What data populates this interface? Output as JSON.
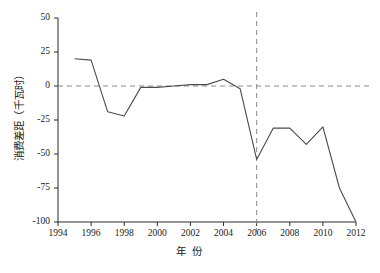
{
  "chart_data": {
    "type": "line",
    "title": "",
    "xlabel": "年 份",
    "ylabel": "消费差距（千瓦时）",
    "xlim": [
      1994,
      2012
    ],
    "ylim": [
      -100,
      50
    ],
    "xticks": [
      1994,
      1996,
      1998,
      2000,
      2002,
      2004,
      2006,
      2008,
      2010,
      2012
    ],
    "yticks": [
      50,
      25,
      0,
      -25,
      -50,
      -75,
      -100
    ],
    "grid": false,
    "legend": null,
    "x": [
      1995,
      1996,
      1997,
      1998,
      1999,
      2000,
      2001,
      2002,
      2003,
      2004,
      2005,
      2006,
      2007,
      2008,
      2009,
      2010,
      2011,
      2012
    ],
    "values": [
      20,
      19,
      -19,
      -22,
      -1,
      -1,
      0,
      1,
      1,
      5,
      -2,
      -54,
      -31,
      -31,
      -43,
      -30,
      -75,
      -100
    ],
    "series": [
      {
        "name": "消费差距",
        "values": [
          20,
          19,
          -19,
          -22,
          -1,
          -1,
          0,
          1,
          1,
          5,
          -2,
          -54,
          -31,
          -31,
          -43,
          -30,
          -75,
          -100
        ]
      }
    ],
    "annotations": [
      {
        "name": "zero-reference-line",
        "type": "hline",
        "value": 0,
        "style": "dashed"
      },
      {
        "name": "year-marker-line",
        "type": "vline",
        "value": 2006,
        "style": "dashed"
      }
    ],
    "line_color": "#4a4a4a",
    "dash_color": "#8a8a8a",
    "axis_color": "#2a2a2a"
  },
  "axis": {
    "y_tick_labels": [
      "50",
      "25",
      "0",
      "-25",
      "-50",
      "-75",
      "-100"
    ],
    "x_tick_labels": [
      "1994",
      "1996",
      "1998",
      "2000",
      "2002",
      "2004",
      "2006",
      "2008",
      "2010",
      "2012"
    ],
    "y_title": "消费差距（千瓦时）",
    "x_title": "年 份"
  }
}
